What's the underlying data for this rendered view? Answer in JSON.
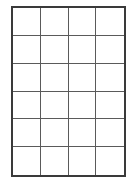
{
  "grid": {
    "columns": 4,
    "rows": 6,
    "cells": [
      [
        "",
        "",
        "",
        ""
      ],
      [
        "",
        "",
        "",
        ""
      ],
      [
        "",
        "",
        "",
        ""
      ],
      [
        "",
        "",
        "",
        ""
      ],
      [
        "",
        "",
        "",
        ""
      ],
      [
        "",
        "",
        "",
        ""
      ]
    ],
    "colors": {
      "background": "#ffffff",
      "outer_border": "#3a3a3a",
      "inner_lines": "#5a5a5a"
    }
  }
}
